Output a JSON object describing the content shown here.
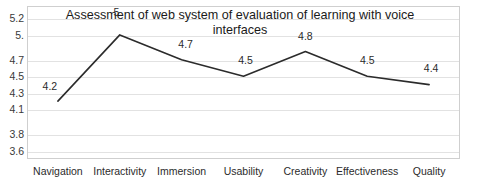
{
  "chart_data": {
    "type": "line",
    "title": "Assessment of web system of evaluation of learning with voice interfaces",
    "title_line1": "Assessment of web system of evaluation of learning with voice",
    "title_line2": "interfaces",
    "xlabel": "",
    "ylabel": "",
    "categories": [
      "Navigation",
      "Interactivity",
      "Immersion",
      "Usability",
      "Creativity",
      "Effectiveness",
      "Quality"
    ],
    "values": [
      4.2,
      5.0,
      4.7,
      4.5,
      4.8,
      4.5,
      4.4
    ],
    "point_labels": [
      "4.2",
      "5.",
      "4.7",
      "4.5",
      "4.8",
      "4.5",
      "4.4"
    ],
    "ytick_labels": [
      "5.2",
      "5.",
      "4.7",
      "4.5",
      "4.3",
      "4.1",
      "3.8",
      "3.6"
    ],
    "ytick_values": [
      5.2,
      5.0,
      4.7,
      4.5,
      4.3,
      4.1,
      3.8,
      3.6
    ],
    "ylim": [
      3.5,
      5.35
    ],
    "grid": true,
    "legend": "none",
    "series_color": "#2b2b2b",
    "grid_color": "#e2e2e2",
    "frame_color": "#cfcfcf",
    "background_color": "#ffffff"
  }
}
